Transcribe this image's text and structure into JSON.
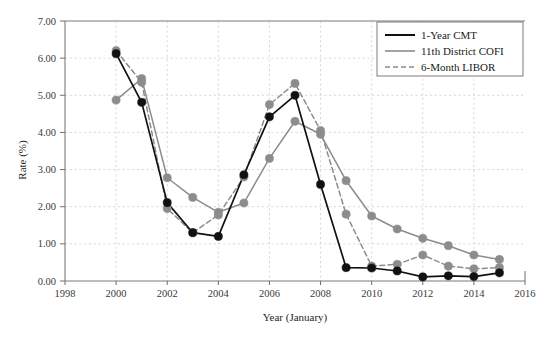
{
  "chart_data": {
    "type": "line",
    "title": "",
    "xlabel": "Year (January)",
    "ylabel": "Rate (%)",
    "xlim": [
      1998,
      2016
    ],
    "ylim": [
      0.0,
      7.0
    ],
    "xticks": [
      "1998",
      "2000",
      "2002",
      "2004",
      "2006",
      "2008",
      "2010",
      "2012",
      "2014",
      "2016"
    ],
    "yticks": [
      "0.00",
      "1.00",
      "2.00",
      "3.00",
      "4.00",
      "5.00",
      "6.00",
      "7.00"
    ],
    "grid": true,
    "legend_position": "top-right",
    "x": [
      2000,
      2001,
      2002,
      2003,
      2004,
      2005,
      2006,
      2007,
      2008,
      2009,
      2010,
      2011,
      2012,
      2013,
      2014,
      2015
    ],
    "series": [
      {
        "name": "1-Year CMT",
        "color": "#111111",
        "style": "solid",
        "marker": "circle",
        "values": [
          6.12,
          4.81,
          2.11,
          1.3,
          1.2,
          2.86,
          4.42,
          5.0,
          2.6,
          0.36,
          0.35,
          0.27,
          0.11,
          0.14,
          0.12,
          0.22
        ]
      },
      {
        "name": "11th District COFI",
        "color": "#8c8c8c",
        "style": "solid",
        "marker": "circle",
        "values": [
          4.87,
          5.45,
          2.78,
          2.25,
          1.85,
          2.1,
          3.3,
          4.3,
          3.95,
          2.7,
          1.75,
          1.4,
          1.15,
          0.95,
          0.7,
          0.58
        ]
      },
      {
        "name": "6-Month LIBOR",
        "color": "#8c8c8c",
        "style": "dashed",
        "marker": "circle",
        "values": [
          6.2,
          5.35,
          1.95,
          1.3,
          1.78,
          2.8,
          4.75,
          5.32,
          4.05,
          1.8,
          0.4,
          0.45,
          0.7,
          0.4,
          0.33,
          0.36
        ]
      }
    ]
  },
  "legend": {
    "items": [
      {
        "label": "1-Year CMT"
      },
      {
        "label": "11th District COFI"
      },
      {
        "label": "6-Month LIBOR"
      }
    ]
  },
  "axes": {
    "y_title": "Rate (%)",
    "x_title": "Year (January)"
  },
  "colors": {
    "series_black": "#111111",
    "series_gray": "#8c8c8c",
    "grid": "#cfcfcf",
    "axis": "#7a7a7a",
    "background": "#ffffff"
  }
}
